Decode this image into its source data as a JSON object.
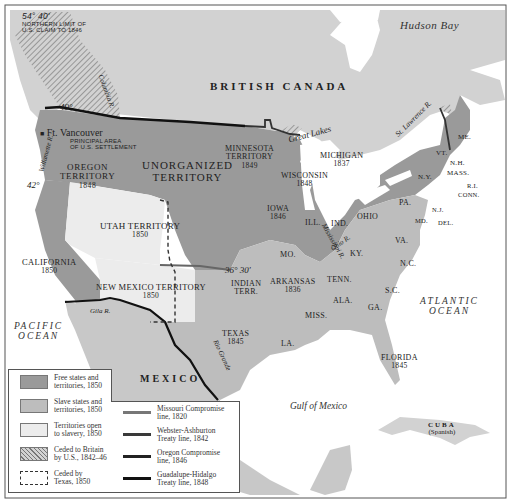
{
  "map": {
    "colors": {
      "free": "#9a9a9a",
      "slave": "#bdbdbd",
      "open": "#ececec",
      "canada": "#d2d2d2",
      "mexico": "#c8c8c8",
      "water": "#ffffff",
      "frame": "#555555"
    },
    "regions": {
      "british_canada": "BRITISH CANADA",
      "mexico": "MEXICO",
      "cuba": "CUBA",
      "cuba_note": "(Spanish)"
    },
    "water_bodies": {
      "hudson_bay": "Hudson Bay",
      "pacific": [
        "PACIFIC",
        "OCEAN"
      ],
      "atlantic": [
        "ATLANTIC",
        "OCEAN"
      ],
      "gulf": "Gulf of Mexico",
      "great_lakes": "Great Lakes"
    },
    "rivers": {
      "st_lawrence": "St. Lawrence R.",
      "mississippi": "Mississippi R.",
      "ohio": "Ohio R.",
      "rio_grande": "Rio Grande",
      "gila": "Gila R.",
      "columbia": "Columbia R.",
      "willamette": "Willamette R."
    },
    "annotations": {
      "lat_5440": "54° 40'",
      "northern_limit": [
        "NORTHERN LIMIT OF",
        "U.S. CLAIM TO 1846"
      ],
      "lat_49": "49°",
      "lat_42": "42°",
      "lat_3630": "36° 30'",
      "ft_vancouver": "Ft. Vancouver",
      "settlement": [
        "PRINCIPAL AREA",
        "OF U.S. SETTLEMENT"
      ]
    },
    "territories": {
      "oregon": [
        "OREGON",
        "TERRITORY",
        "1848"
      ],
      "unorganized": [
        "UNORGANIZED",
        "TERRITORY"
      ],
      "minnesota": [
        "MINNESOTA",
        "TERRITORY",
        "1849"
      ],
      "utah": [
        "UTAH TERRITORY",
        "1850"
      ],
      "new_mexico": [
        "NEW MEXICO TERRITORY",
        "1850"
      ],
      "indian": [
        "INDIAN",
        "TERR."
      ]
    },
    "states": {
      "california": [
        "CALIFORNIA",
        "1850"
      ],
      "wisconsin": [
        "WISCONSIN",
        "1848"
      ],
      "michigan": [
        "MICHIGAN",
        "1837"
      ],
      "iowa": [
        "IOWA",
        "1846"
      ],
      "ill": "ILL.",
      "ind": "IND.",
      "ohio": "OHIO",
      "pa": "PA.",
      "ny": "N.Y.",
      "vt": "VT.",
      "nh": "N.H.",
      "me": "ME.",
      "mass": "MASS.",
      "ri": "R.I.",
      "conn": "CONN.",
      "nj": "N.J.",
      "del": "DEL.",
      "md": "MD.",
      "va": "VA.",
      "nc": "N.C.",
      "sc": "S.C.",
      "ga": "GA.",
      "ala": "ALA.",
      "miss": "MISS.",
      "la": "LA.",
      "tenn": "TENN.",
      "ky": "KY.",
      "mo": "MO.",
      "arkansas": [
        "ARKANSAS",
        "1836"
      ],
      "texas": [
        "TEXAS",
        "1845"
      ],
      "florida": [
        "FLORIDA",
        "1845"
      ]
    }
  },
  "legend": {
    "areas": [
      {
        "label": [
          "Free states and",
          "territories, 1850"
        ],
        "color": "#9a9a9a"
      },
      {
        "label": [
          "Slave states and",
          "territories, 1850"
        ],
        "color": "#bdbdbd"
      },
      {
        "label": [
          "Territories open",
          "to slavery, 1850"
        ],
        "color": "#ececec"
      },
      {
        "label": [
          "Ceded to Britain",
          "by U.S., 1842–46"
        ],
        "pattern": "hatched"
      },
      {
        "label": [
          "Ceded by",
          "Texas, 1850"
        ],
        "pattern": "dashed"
      }
    ],
    "lines": [
      {
        "label": [
          "Missouri Compromise",
          "line, 1820"
        ],
        "color": "#777777"
      },
      {
        "label": [
          "Webster-Ashburton",
          "Treaty line, 1842"
        ],
        "color": "#3a3a3a"
      },
      {
        "label": [
          "Oregon Compromise",
          "line, 1846"
        ],
        "color": "#222222"
      },
      {
        "label": [
          "Guadalupe-Hidalgo",
          "Treaty line, 1848"
        ],
        "color": "#111111"
      }
    ]
  }
}
